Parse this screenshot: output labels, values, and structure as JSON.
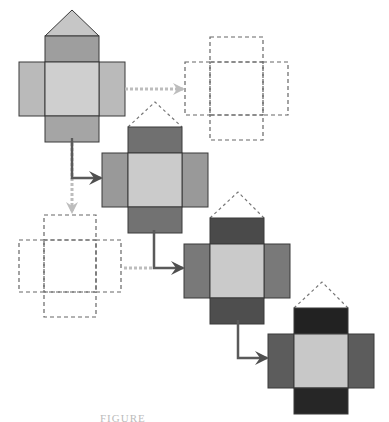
{
  "diagram": {
    "colors": {
      "background": "#ffffff",
      "stroke": "#3a3a3a",
      "dashed": "#666666",
      "light_arrow": "#bdbdbd",
      "dark_arrow": "#5a5a5a"
    },
    "nets": [
      {
        "id": "net-1",
        "state": "filled",
        "x": 19,
        "y": 36,
        "arm": 26,
        "side": 54,
        "apex": [
          72,
          10
        ],
        "triangle": "solid",
        "fills": {
          "center": "#cfcfcf",
          "side": "#bababa",
          "top": "#9e9e9e",
          "bottom": "#a5a5a5",
          "triangle": "#c6c6c6"
        }
      },
      {
        "id": "net-ghost-right",
        "state": "dashed-outline",
        "x": 185,
        "y": 37,
        "arm": 25,
        "side": 53
      },
      {
        "id": "net-2",
        "state": "filled",
        "x": 102,
        "y": 127,
        "arm": 26,
        "side": 54,
        "apex": [
          155,
          102
        ],
        "triangle": "dashed",
        "fills": {
          "center": "#cbcbcb",
          "side": "#999999",
          "top": "#707070",
          "bottom": "#727272"
        }
      },
      {
        "id": "net-ghost-left",
        "state": "dashed-outline",
        "x": 19,
        "y": 215,
        "arm": 25,
        "side": 52
      },
      {
        "id": "net-3",
        "state": "filled",
        "x": 184,
        "y": 218,
        "arm": 26,
        "side": 54,
        "apex": [
          238,
          192
        ],
        "triangle": "dashed",
        "fills": {
          "center": "#cacaca",
          "side": "#797979",
          "top": "#4a4a4a",
          "bottom": "#4e4e4e"
        }
      },
      {
        "id": "net-4",
        "state": "filled",
        "x": 268,
        "y": 308,
        "arm": 26,
        "side": 54,
        "apex": [
          322,
          282
        ],
        "triangle": "dashed",
        "fills": {
          "center": "#c8c8c8",
          "side": "#5c5c5c",
          "top": "#222222",
          "bottom": "#262626"
        }
      }
    ],
    "arrows": [
      {
        "id": "arrow-net1-to-ghost-right",
        "style": "dotted-light",
        "points": [
          [
            125,
            89
          ],
          [
            183,
            89
          ]
        ]
      },
      {
        "id": "arrow-net1-to-ghost-left",
        "style": "dotted-light",
        "points": [
          [
            72,
            138
          ],
          [
            72,
            212
          ]
        ]
      },
      {
        "id": "arrow-net1-to-net2",
        "style": "dotted-dark-branch",
        "points": [
          [
            72,
            138
          ],
          [
            72,
            178
          ],
          [
            101,
            178
          ]
        ]
      },
      {
        "id": "arrow-ghost-left-join",
        "style": "dotted-light",
        "points": [
          [
            124,
            268
          ],
          [
            154,
            268
          ]
        ]
      },
      {
        "id": "arrow-net2-to-net3",
        "style": "solid-dark",
        "points": [
          [
            154,
            230
          ],
          [
            154,
            268
          ],
          [
            183,
            268
          ]
        ]
      },
      {
        "id": "arrow-net3-to-net4",
        "style": "solid-dark",
        "points": [
          [
            238,
            320
          ],
          [
            238,
            358
          ],
          [
            267,
            358
          ]
        ]
      }
    ],
    "caption": "FIGURE"
  }
}
